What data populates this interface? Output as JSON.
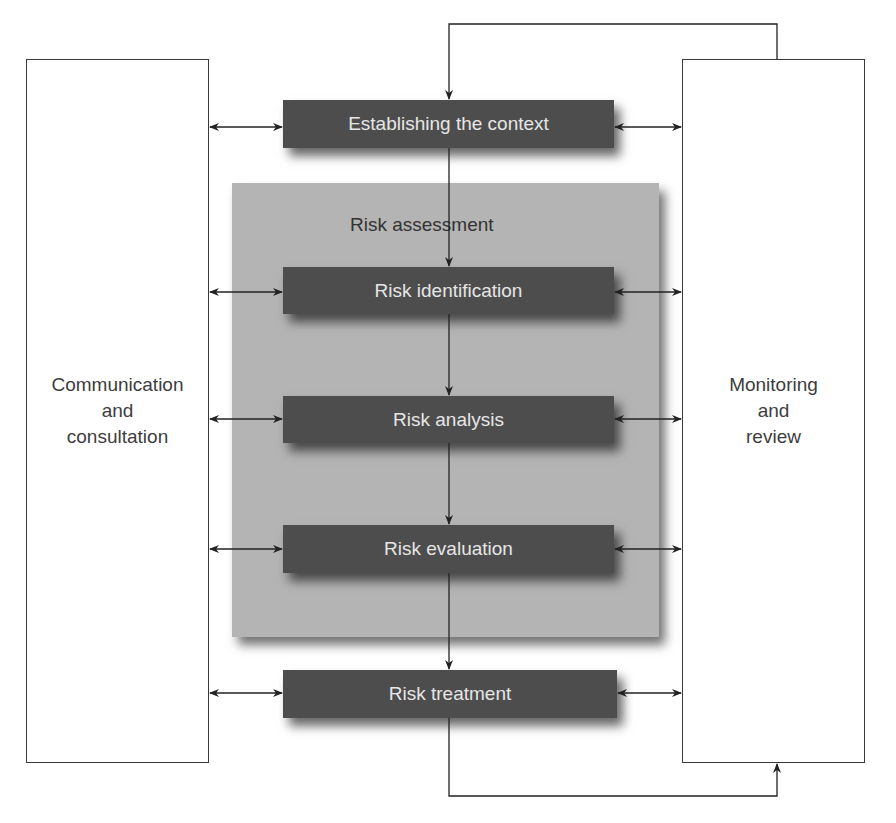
{
  "diagram": {
    "left_box": {
      "label": "Communication\nand\nconsultation"
    },
    "right_box": {
      "label": "Monitoring\nand\nreview"
    },
    "panel": {
      "label": "Risk assessment"
    },
    "steps": [
      {
        "id": "context",
        "label": "Establishing the context"
      },
      {
        "id": "identification",
        "label": "Risk identification"
      },
      {
        "id": "analysis",
        "label": "Risk analysis"
      },
      {
        "id": "evaluation",
        "label": "Risk evaluation"
      },
      {
        "id": "treatment",
        "label": "Risk treatment"
      }
    ],
    "colors": {
      "step_fill": "#4d4d4d",
      "step_text": "#e6e6e6",
      "panel_fill": "#b4b4b4",
      "line": "#222222"
    }
  }
}
